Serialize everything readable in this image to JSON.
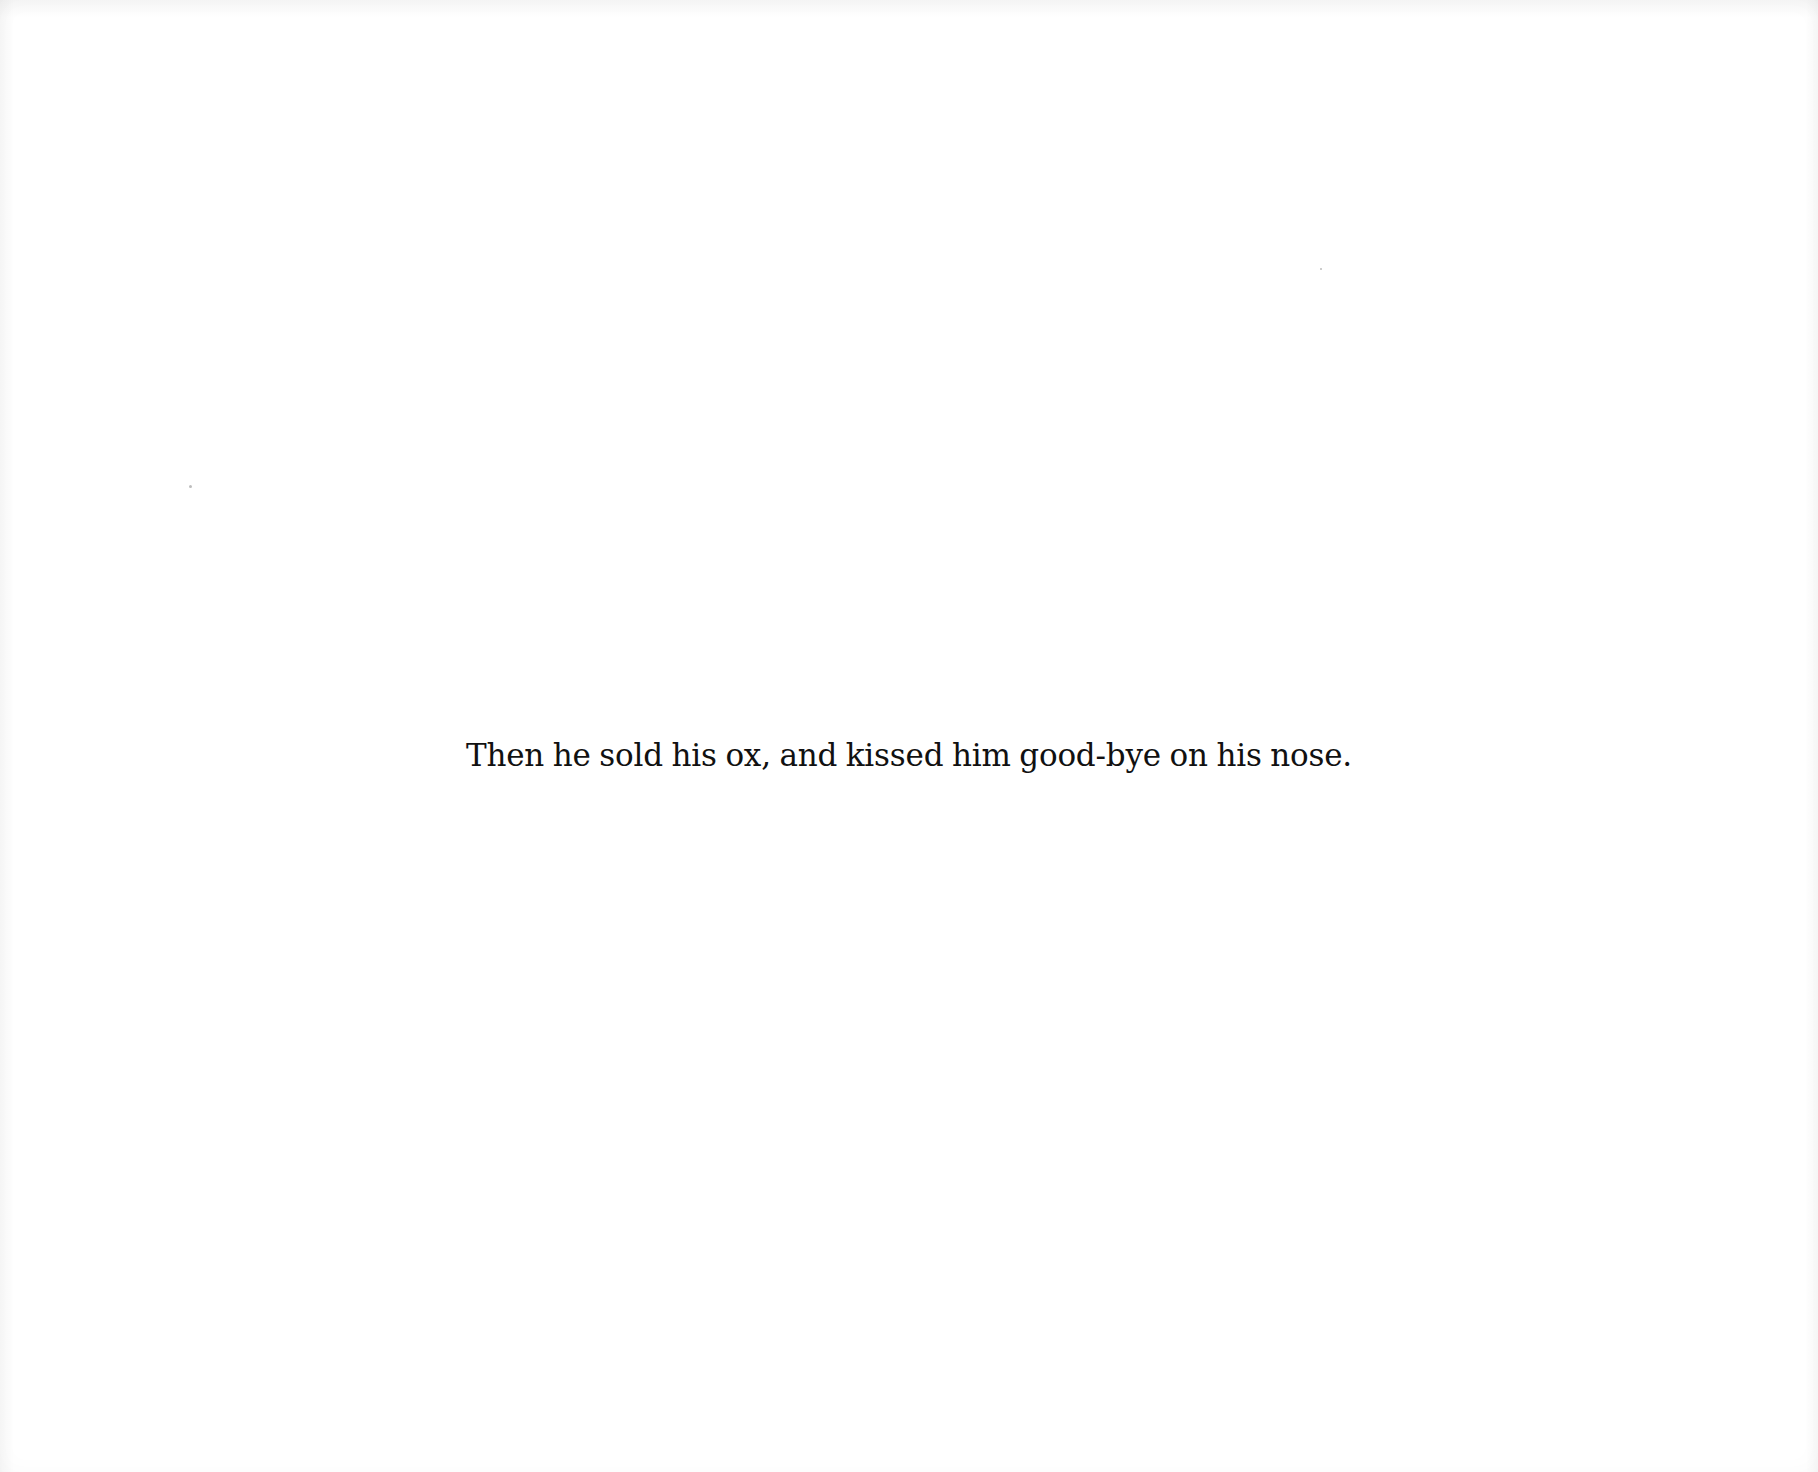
{
  "page": {
    "caption": "Then he sold his ox, and kissed him good-bye on his nose.",
    "background_color": "#ffffff",
    "text_color": "#111111"
  }
}
